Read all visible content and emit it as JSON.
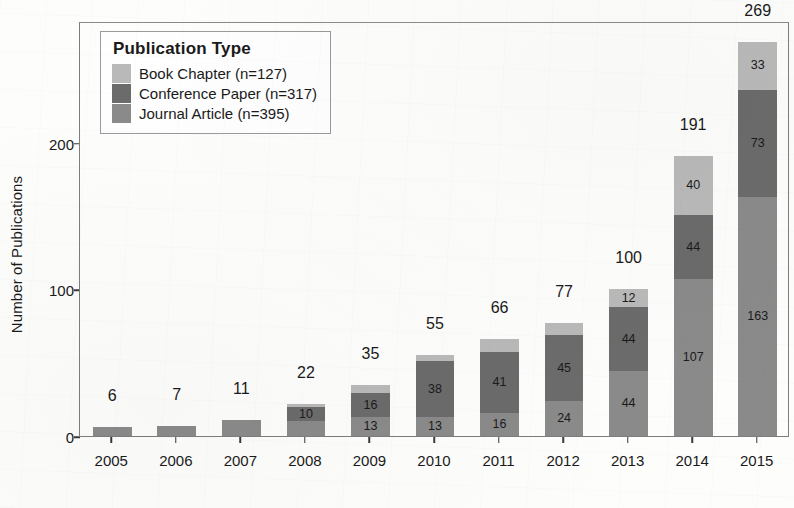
{
  "chart_data": {
    "type": "bar",
    "subtype": "stacked-bar",
    "title": "",
    "xlabel": "",
    "ylabel": "Number of Publications",
    "categories": [
      "2005",
      "2006",
      "2007",
      "2008",
      "2009",
      "2010",
      "2011",
      "2012",
      "2013",
      "2014",
      "2015"
    ],
    "series": [
      {
        "name": "Journal Article",
        "legend": "Journal Article (n=395)",
        "total": 395,
        "color": "#8a8a8a",
        "values": [
          6,
          7,
          11,
          10,
          13,
          13,
          16,
          24,
          44,
          107,
          163
        ]
      },
      {
        "name": "Conference Paper",
        "legend": "Conference Paper (n=317)",
        "total": 317,
        "color": "#6b6b6b",
        "values": [
          0,
          0,
          0,
          10,
          16,
          38,
          41,
          45,
          44,
          44,
          73
        ]
      },
      {
        "name": "Book Chapter",
        "legend": "Book Chapter (n=127)",
        "total": 127,
        "color": "#b9b9b9",
        "values": [
          0,
          0,
          0,
          2,
          6,
          4,
          9,
          8,
          12,
          40,
          33
        ]
      }
    ],
    "totals": [
      6,
      7,
      11,
      22,
      35,
      55,
      66,
      77,
      100,
      191,
      269
    ],
    "segment_labels": {
      "2005": {
        "journal": "",
        "conference": "",
        "book": ""
      },
      "2006": {
        "journal": "",
        "conference": "",
        "book": ""
      },
      "2007": {
        "journal": "",
        "conference": "",
        "book": ""
      },
      "2008": {
        "journal": "",
        "conference": "10",
        "book": ""
      },
      "2009": {
        "journal": "13",
        "conference": "16",
        "book": ""
      },
      "2010": {
        "journal": "13",
        "conference": "38",
        "book": ""
      },
      "2011": {
        "journal": "16",
        "conference": "41",
        "book": ""
      },
      "2012": {
        "journal": "24",
        "conference": "45",
        "book": ""
      },
      "2013": {
        "journal": "44",
        "conference": "44",
        "book": "12"
      },
      "2014": {
        "journal": "107",
        "conference": "44",
        "book": "40"
      },
      "2015": {
        "journal": "163",
        "conference": "73",
        "book": "33"
      }
    },
    "yticks": [
      0,
      100,
      200
    ],
    "ytick_labels": [
      "0",
      "100",
      "200"
    ],
    "ylim": [
      0,
      283
    ],
    "grid": false,
    "legend_position": "top-left",
    "legend_title": "Publication Type"
  },
  "axes": {
    "y_title": "Number of Publications",
    "y_tick_labels": [
      "0",
      "100",
      "200"
    ],
    "x_tick_labels": [
      "2005",
      "2006",
      "2007",
      "2008",
      "2009",
      "2010",
      "2011",
      "2012",
      "2013",
      "2014",
      "2015"
    ]
  },
  "legend": {
    "title": "Publication Type",
    "items": [
      {
        "label": "Book Chapter (n=127)",
        "color": "#b9b9b9"
      },
      {
        "label": "Conference Paper (n=317)",
        "color": "#6b6b6b"
      },
      {
        "label": "Journal Article (n=395)",
        "color": "#8a8a8a"
      }
    ]
  },
  "totals_text": [
    "6",
    "7",
    "11",
    "22",
    "35",
    "55",
    "66",
    "77",
    "100",
    "191",
    "269"
  ],
  "colors": {
    "book_chapter": "#b9b9b9",
    "conference_paper": "#6b6b6b",
    "journal_article": "#8a8a8a",
    "panel_border": "#7d7d7d",
    "text": "#1a1a1a",
    "background": "#fdfdfc"
  }
}
